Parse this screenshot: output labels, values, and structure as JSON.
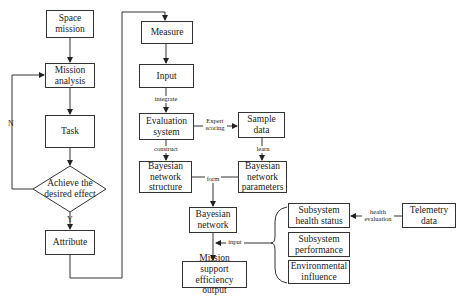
{
  "diagram": {
    "left_flow": {
      "space_mission": "Space mission",
      "mission_analysis": "Mission analysis",
      "task": "Task",
      "decision": "Achieve the desired effect",
      "decision_no": "N",
      "decision_yes": "Y",
      "attribute": "Attribute"
    },
    "right_flow": {
      "measure": "Measure",
      "input": "Input",
      "integrate": "integrate",
      "evaluation_system": "Evaluation system",
      "expert_scoring": "Expert scoring",
      "sample_data": "Sample data",
      "construct": "construct",
      "learn": "learn",
      "bn_structure": "Bayesian network structure",
      "bn_parameters": "Bayesian network parameters",
      "form": "form",
      "bayesian_network": "Bayesian network",
      "input_label": "input",
      "mission_support": "Mission support efficiency output"
    },
    "subsystems": {
      "health_status": "Subsystem health status",
      "performance": "Subsystem performance",
      "environmental": "Environmental influence",
      "health_evaluation": "health evaluation",
      "telemetry": "Telemetry data"
    }
  }
}
